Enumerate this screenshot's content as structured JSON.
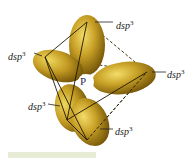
{
  "diagram": {
    "central_atom": {
      "label": "P",
      "x": 86,
      "y": 82
    },
    "orbital_color": "#c9a227",
    "orbital_shadow": "#7a5a08",
    "labels": [
      {
        "id": "top",
        "base": "dsp",
        "exp": "3",
        "x": 116,
        "y": 18
      },
      {
        "id": "left",
        "base": "dsp",
        "exp": "3",
        "x": 8,
        "y": 49
      },
      {
        "id": "right",
        "base": "dsp",
        "exp": "3",
        "x": 168,
        "y": 67
      },
      {
        "id": "lower-left",
        "base": "dsp",
        "exp": "3",
        "x": 28,
        "y": 100
      },
      {
        "id": "bottom",
        "base": "dsp",
        "exp": "3",
        "x": 115,
        "y": 125
      }
    ]
  }
}
